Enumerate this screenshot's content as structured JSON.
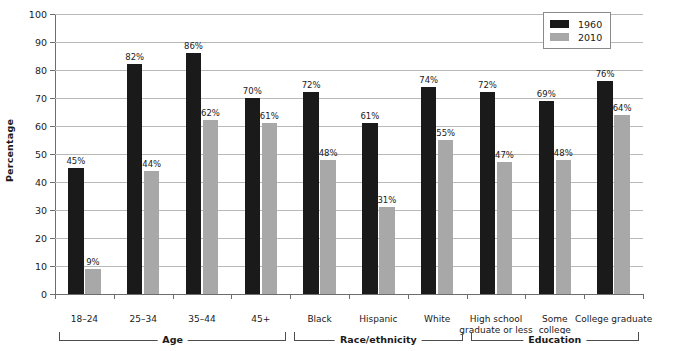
{
  "chart_data": {
    "type": "bar",
    "title": "",
    "xlabel": "",
    "ylabel": "Percentage",
    "ylim": [
      0,
      100
    ],
    "ytick_step": 10,
    "yticks": [
      0,
      10,
      20,
      30,
      40,
      50,
      60,
      70,
      80,
      90,
      100
    ],
    "grid": true,
    "value_suffix": "%",
    "legend_position": "top-right",
    "categories": [
      "18–24",
      "25–34",
      "35–44",
      "45+",
      "Black",
      "Hispanic",
      "White",
      "High school\ngraduate or less",
      "Some\ncollege",
      "College graduate"
    ],
    "series": [
      {
        "name": "1960",
        "color": "#1a1a1a",
        "values": [
          45,
          82,
          86,
          70,
          72,
          61,
          74,
          72,
          69,
          76
        ],
        "labels": [
          "45%",
          "82%",
          "86%",
          "70%",
          "72%",
          "61%",
          "74%",
          "72%",
          "69%",
          "76%"
        ]
      },
      {
        "name": "2010",
        "color": "#a8a8a8",
        "values": [
          9,
          44,
          62,
          61,
          48,
          31,
          55,
          47,
          48,
          64
        ],
        "labels": [
          "9%",
          "44%",
          "62%",
          "61%",
          "48%",
          "31%",
          "55%",
          "47%",
          "48%",
          "64%"
        ]
      }
    ],
    "groups": [
      {
        "label": "Age",
        "first": 0,
        "last": 3
      },
      {
        "label": "Race/ethnicity",
        "first": 4,
        "last": 6
      },
      {
        "label": "Education",
        "first": 7,
        "last": 9
      }
    ]
  }
}
